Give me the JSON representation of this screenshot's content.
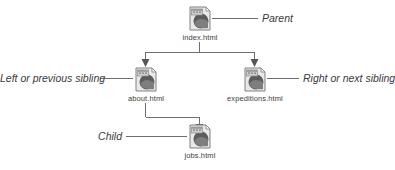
{
  "diagram": {
    "type": "tree-diagram",
    "background_color": "#ffffff",
    "line_color": "#6e6e6e",
    "text_color": "#3a3a3a",
    "nodes": [
      {
        "id": "index",
        "label": "index.html",
        "icon": "html-document-icon",
        "role": "parent"
      },
      {
        "id": "about",
        "label": "about.html",
        "icon": "html-document-icon",
        "role": "left-sibling"
      },
      {
        "id": "expeditions",
        "label": "expeditions.html",
        "icon": "html-document-icon",
        "role": "right-sibling"
      },
      {
        "id": "jobs",
        "label": "jobs.html",
        "icon": "html-document-icon",
        "role": "child"
      }
    ],
    "callouts": [
      {
        "id": "parent",
        "text": "Parent"
      },
      {
        "id": "left-sibling",
        "text": "Left or previous sibling"
      },
      {
        "id": "right-sibling",
        "text": "Right or next sibling"
      },
      {
        "id": "child",
        "text": "Child"
      }
    ],
    "edges": [
      {
        "from": "index",
        "to": "about",
        "style": "elbow-arrow"
      },
      {
        "from": "index",
        "to": "expeditions",
        "style": "elbow-arrow"
      },
      {
        "from": "about",
        "to": "jobs",
        "style": "elbow-arrow"
      }
    ]
  }
}
